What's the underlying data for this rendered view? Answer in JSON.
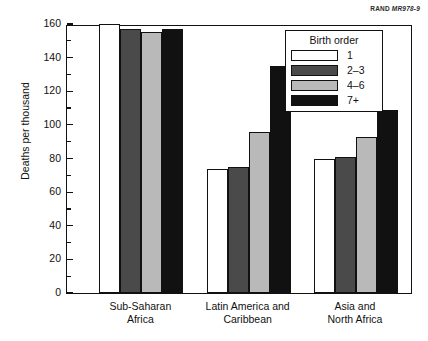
{
  "source_credit": {
    "publisher": "RAND",
    "report_id": "MR978-9"
  },
  "legend": {
    "title": "Birth order",
    "entries": [
      {
        "label": "1",
        "color": "#ffffff"
      },
      {
        "label": "2–3",
        "color": "#4a4a4a"
      },
      {
        "label": "4–6",
        "color": "#b9b9b9"
      },
      {
        "label": "7+",
        "color": "#111111"
      }
    ]
  },
  "chart_data": {
    "type": "bar",
    "title": "",
    "xlabel": "",
    "ylabel": "Deaths per thousand",
    "ylim": [
      0,
      160
    ],
    "ytick_step": 20,
    "yticks": [
      0,
      20,
      40,
      60,
      80,
      100,
      120,
      140,
      160
    ],
    "grid": false,
    "legend_position": "upper right",
    "categories": [
      "Sub-Saharan\nAfrica",
      "Latin America and\nCaribbean",
      "Asia and\nNorth Africa"
    ],
    "category_lines": [
      [
        "Sub-Saharan",
        "Africa"
      ],
      [
        "Latin America and",
        "Caribbean"
      ],
      [
        "Asia and",
        "North Africa"
      ]
    ],
    "series": [
      {
        "name": "1",
        "color": "#ffffff",
        "values": [
          160,
          74,
          80
        ]
      },
      {
        "name": "2–3",
        "color": "#4a4a4a",
        "values": [
          157,
          75,
          81
        ]
      },
      {
        "name": "4–6",
        "color": "#b9b9b9",
        "values": [
          155,
          96,
          93
        ]
      },
      {
        "name": "7+",
        "color": "#111111",
        "values": [
          157,
          135,
          109
        ]
      }
    ]
  }
}
